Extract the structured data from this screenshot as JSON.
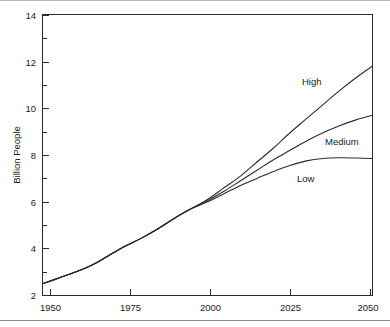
{
  "figure": {
    "background_color": "#ffffff",
    "line_color": "#2b2b2b",
    "rule_top_color": "#b9b9b9",
    "rule_bottom_color": "#8a8a8a"
  },
  "axes": {
    "y_title": "Billion People",
    "y_ticks": [
      "2",
      "4",
      "6",
      "8",
      "10",
      "12",
      "14"
    ],
    "x_ticks": [
      "1950",
      "1975",
      "2000",
      "2025",
      "2050"
    ]
  },
  "labels": {
    "high": "High",
    "medium": "Medium",
    "low": "Low"
  },
  "chart_data": {
    "type": "line",
    "title": "",
    "subtitle": "",
    "xlabel": "",
    "ylabel": "Billion People",
    "xlim": [
      1950,
      2050
    ],
    "ylim": [
      2,
      14
    ],
    "xticks": [
      1950,
      1975,
      2000,
      2025,
      2050
    ],
    "yticks": [
      2,
      4,
      6,
      8,
      10,
      12,
      14
    ],
    "minor_ticks": true,
    "grid": false,
    "legend": "inline-labels",
    "legend_position": "right-of-curves",
    "annotations": [
      {
        "text": "High",
        "x": 2028,
        "y": 10.6
      },
      {
        "text": "Medium",
        "x": 2036,
        "y": 8.6
      },
      {
        "text": "Low",
        "x": 2028,
        "y": 7.0
      }
    ],
    "x": [
      1950,
      1955,
      1960,
      1965,
      1970,
      1975,
      1980,
      1985,
      1990,
      1995,
      2000,
      2005,
      2010,
      2015,
      2020,
      2025,
      2030,
      2035,
      2040,
      2045,
      2050
    ],
    "series": [
      {
        "name": "High",
        "values": [
          2.5,
          2.75,
          3.0,
          3.3,
          3.7,
          4.1,
          4.45,
          4.85,
          5.3,
          5.7,
          6.1,
          6.6,
          7.1,
          7.7,
          8.3,
          8.95,
          9.55,
          10.15,
          10.75,
          11.3,
          11.8
        ]
      },
      {
        "name": "Medium",
        "values": [
          2.5,
          2.75,
          3.0,
          3.3,
          3.7,
          4.1,
          4.45,
          4.85,
          5.3,
          5.7,
          6.05,
          6.45,
          6.9,
          7.35,
          7.8,
          8.2,
          8.6,
          8.95,
          9.25,
          9.5,
          9.7
        ]
      },
      {
        "name": "Low",
        "values": [
          2.5,
          2.75,
          3.0,
          3.3,
          3.7,
          4.1,
          4.45,
          4.85,
          5.3,
          5.7,
          6.0,
          6.35,
          6.7,
          7.0,
          7.3,
          7.55,
          7.75,
          7.85,
          7.88,
          7.87,
          7.85
        ]
      }
    ]
  }
}
